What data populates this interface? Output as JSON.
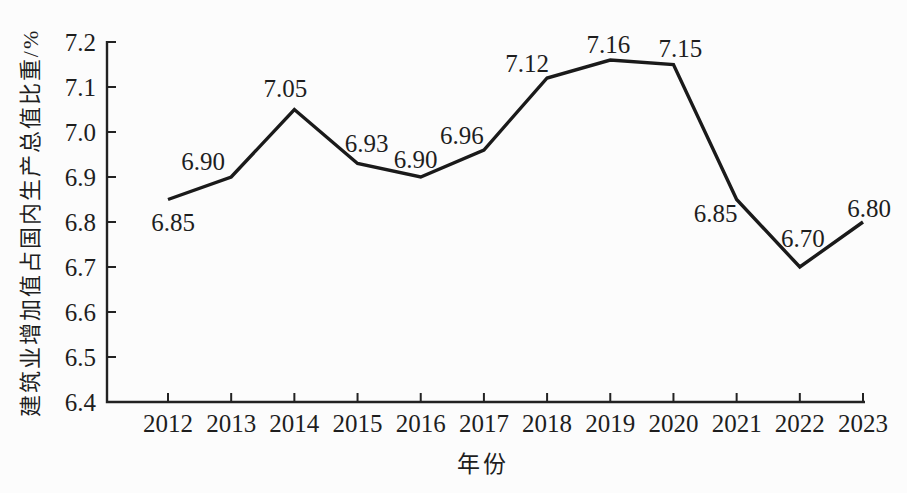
{
  "chart_data": {
    "type": "line",
    "title": "",
    "xlabel": "年份",
    "ylabel": "建筑业增加值占国内生产总值比重/%",
    "categories": [
      "2012",
      "2013",
      "2014",
      "2015",
      "2016",
      "2017",
      "2018",
      "2019",
      "2020",
      "2021",
      "2022",
      "2023"
    ],
    "values": [
      6.85,
      6.9,
      7.05,
      6.93,
      6.9,
      6.96,
      7.12,
      7.16,
      7.15,
      6.85,
      6.7,
      6.8
    ],
    "data_labels": [
      "6.85",
      "6.90",
      "7.05",
      "6.93",
      "6.90",
      "6.96",
      "7.12",
      "7.16",
      "7.15",
      "6.85",
      "6.70",
      "6.80"
    ],
    "yticks": [
      "6.4",
      "6.5",
      "6.6",
      "6.7",
      "6.8",
      "6.9",
      "7.0",
      "7.1",
      "7.2"
    ],
    "ylim": [
      6.4,
      7.2
    ],
    "grid": false,
    "legend": "none",
    "line_color": "#1a1a1a",
    "axis_color": "#222222",
    "text_color": "#1e1e1e",
    "background_color": "#fcfcfc",
    "label_offsets": [
      [
        5,
        23
      ],
      [
        -28,
        -16
      ],
      [
        -9,
        -21
      ],
      [
        9,
        -20
      ],
      [
        -5,
        -18
      ],
      [
        -22,
        -15
      ],
      [
        -20,
        -15
      ],
      [
        -2,
        -16
      ],
      [
        7,
        -16
      ],
      [
        -21,
        14
      ],
      [
        3,
        -29
      ],
      [
        6,
        -14
      ]
    ]
  }
}
